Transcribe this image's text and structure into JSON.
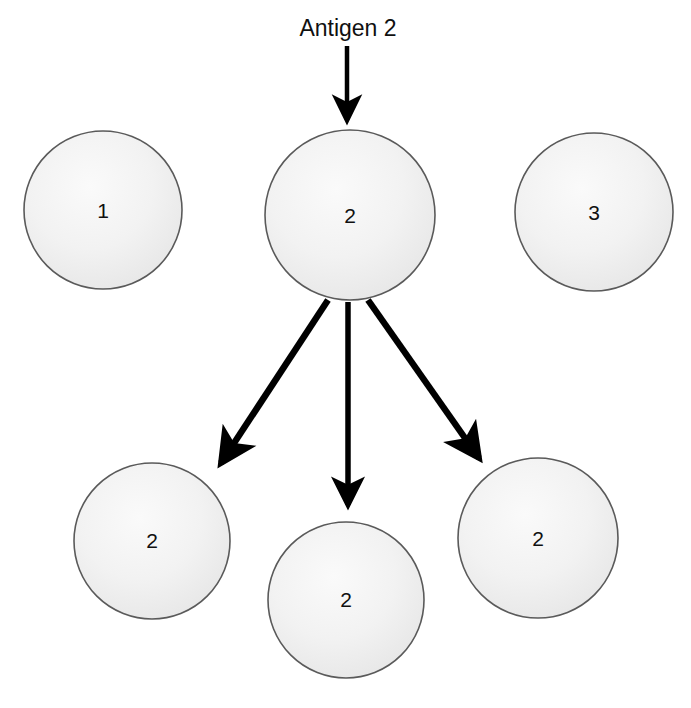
{
  "diagram": {
    "title_label": "Antigen 2",
    "colors": {
      "cell_fill_light": "#f7f7f7",
      "cell_fill_mid": "#ededed",
      "cell_fill_edge": "#e4e4e4",
      "cell_stroke": "#5a5a5a",
      "arrow": "#000000",
      "label_text": "#101010",
      "background": "#ffffff"
    },
    "top_row": [
      {
        "id": "cell-1",
        "label": "1",
        "cx": 103,
        "cy": 210,
        "r": 79
      },
      {
        "id": "cell-2",
        "label": "2",
        "cx": 350,
        "cy": 215,
        "r": 85
      },
      {
        "id": "cell-3",
        "label": "3",
        "cx": 594,
        "cy": 212,
        "r": 79
      }
    ],
    "bottom_row": [
      {
        "id": "cell-clone-left",
        "label": "2",
        "cx": 152,
        "cy": 541,
        "r": 78
      },
      {
        "id": "cell-clone-center",
        "label": "2",
        "cx": 346,
        "cy": 600,
        "r": 78
      },
      {
        "id": "cell-clone-right",
        "label": "2",
        "cx": 538,
        "cy": 538,
        "r": 80
      }
    ],
    "arrows": [
      {
        "id": "antigen-arrow",
        "x1": 347,
        "y1": 46,
        "x2": 347,
        "y2": 126
      },
      {
        "id": "division-arrow-left",
        "x1": 328,
        "y1": 300,
        "x2": 215,
        "y2": 473
      },
      {
        "id": "division-arrow-center",
        "x1": 348,
        "y1": 302,
        "x2": 348,
        "y2": 516
      },
      {
        "id": "division-arrow-right",
        "x1": 368,
        "y1": 300,
        "x2": 486,
        "y2": 468
      }
    ]
  }
}
